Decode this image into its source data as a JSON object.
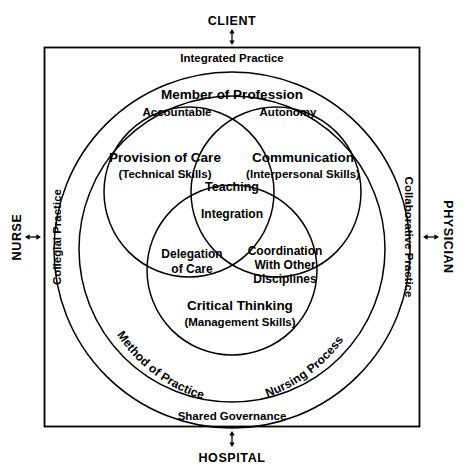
{
  "diagram": {
    "stakeholders": {
      "top": "CLIENT",
      "left": "NURSE",
      "right": "PHYSICIAN",
      "bottom": "HOSPITAL"
    },
    "frame_labels": {
      "top": "Integrated Practice",
      "left": "Collegial Practice",
      "right": "Collaborative Practice",
      "bottom": "Shared Governance"
    },
    "outer_ring_labels": {
      "top": "Member of Profession",
      "top_left": "Accountable",
      "top_right": "Autonomy",
      "bottom_left": "Method of Practice",
      "bottom_right": "Nursing Process"
    },
    "venn": {
      "left": {
        "title": "Provision of Care",
        "subtitle": "(Technical Skills)"
      },
      "right": {
        "title": "Communication",
        "subtitle": "(Interpersonal Skills)"
      },
      "bottom": {
        "title": "Critical Thinking",
        "subtitle": "(Management Skills)"
      },
      "overlap_left_right": "Teaching",
      "overlap_left_bottom_line1": "Delegation",
      "overlap_left_bottom_line2": "of Care",
      "overlap_right_bottom_line1": "Coordination",
      "overlap_right_bottom_line2": "With Other",
      "overlap_right_bottom_line3": "Disciplines",
      "overlap_center": "Integration"
    },
    "arrow_icon": "double-headed-vertical-arrow-icon",
    "colors": {
      "stroke": "#000000",
      "text": "#000000",
      "background": "#ffffff"
    }
  }
}
